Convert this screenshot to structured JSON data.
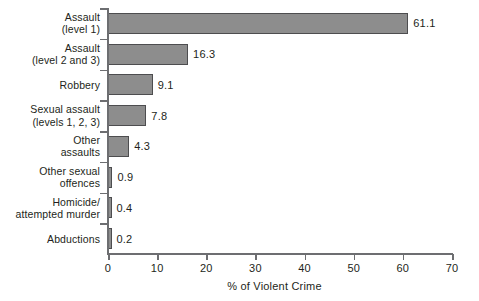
{
  "chart_data": {
    "type": "bar",
    "orientation": "horizontal",
    "title": "",
    "xlabel": "% of Violent Crime",
    "ylabel": "",
    "xlim": [
      0,
      70
    ],
    "xticks": [
      0,
      10,
      20,
      30,
      40,
      50,
      60,
      70
    ],
    "grid": false,
    "legend": null,
    "bar_color": "#8d8d8d",
    "bar_border_color": "#4d4d4f",
    "axis_color": "#6d6e71",
    "text_color": "#231f20",
    "background": "#ffffff",
    "categories": [
      "Assault\n(level 1)",
      "Assault\n(level 2 and 3)",
      "Robbery",
      "Sexual assault\n(levels 1, 2, 3)",
      "Other\nassaults",
      "Other sexual\noffences",
      "Homicide/\nattempted murder",
      "Abductions"
    ],
    "values": [
      61.1,
      16.3,
      9.1,
      7.8,
      4.3,
      0.9,
      0.4,
      0.2
    ],
    "value_labels": [
      "61.1",
      "16.3",
      "9.1",
      "7.8",
      "4.3",
      "0.9",
      "0.4",
      "0.2"
    ],
    "bars": [
      {
        "label_line1": "Assault",
        "label_line2": "(level 1)",
        "value": 61.1,
        "value_label": "61.1"
      },
      {
        "label_line1": "Assault",
        "label_line2": "(level 2 and 3)",
        "value": 16.3,
        "value_label": "16.3"
      },
      {
        "label_line1": "Robbery",
        "label_line2": "",
        "value": 9.1,
        "value_label": "9.1"
      },
      {
        "label_line1": "Sexual assault",
        "label_line2": "(levels 1, 2, 3)",
        "value": 7.8,
        "value_label": "7.8"
      },
      {
        "label_line1": "Other",
        "label_line2": "assaults",
        "value": 4.3,
        "value_label": "4.3"
      },
      {
        "label_line1": "Other sexual",
        "label_line2": "offences",
        "value": 0.9,
        "value_label": "0.9"
      },
      {
        "label_line1": "Homicide/",
        "label_line2": "attempted murder",
        "value": 0.4,
        "value_label": "0.4"
      },
      {
        "label_line1": "Abductions",
        "label_line2": "",
        "value": 0.2,
        "value_label": "0.2"
      }
    ],
    "xtick_labels": [
      "0",
      "10",
      "20",
      "30",
      "40",
      "50",
      "60",
      "70"
    ]
  }
}
